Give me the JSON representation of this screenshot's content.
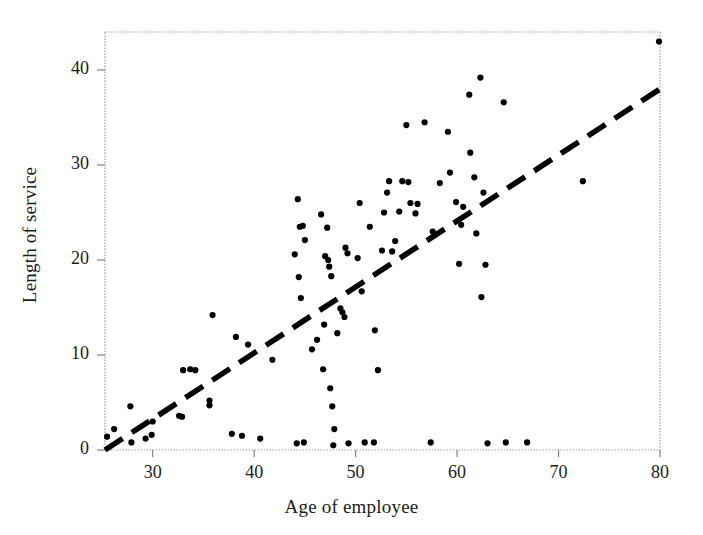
{
  "chart_data": {
    "type": "scatter",
    "title": "",
    "xlabel": "Age of employee",
    "ylabel": "Length of service",
    "xlim": [
      25.3,
      80
    ],
    "ylim": [
      0,
      44
    ],
    "xticks": [
      30,
      40,
      50,
      60,
      70,
      80
    ],
    "yticks": [
      0,
      10,
      20,
      30,
      40
    ],
    "grid": false,
    "legend": null,
    "series": [
      {
        "name": "employees",
        "marker": "filled-circle",
        "color": "#000000",
        "points": [
          [
            25.5,
            1.4
          ],
          [
            26.2,
            2.2
          ],
          [
            27.9,
            0.8
          ],
          [
            27.8,
            4.6
          ],
          [
            29.3,
            1.2
          ],
          [
            29.9,
            1.6
          ],
          [
            30.0,
            3.0
          ],
          [
            32.6,
            3.6
          ],
          [
            32.9,
            3.5
          ],
          [
            33.0,
            8.4
          ],
          [
            33.7,
            8.5
          ],
          [
            34.2,
            8.4
          ],
          [
            35.6,
            4.7
          ],
          [
            35.6,
            5.2
          ],
          [
            35.9,
            14.2
          ],
          [
            37.8,
            1.7
          ],
          [
            38.2,
            11.9
          ],
          [
            38.8,
            1.5
          ],
          [
            39.4,
            11.1
          ],
          [
            40.6,
            1.2
          ],
          [
            41.8,
            9.5
          ],
          [
            44.0,
            20.6
          ],
          [
            44.2,
            0.7
          ],
          [
            44.3,
            26.4
          ],
          [
            44.4,
            18.2
          ],
          [
            44.5,
            23.5
          ],
          [
            44.6,
            16.0
          ],
          [
            44.8,
            23.6
          ],
          [
            44.9,
            0.8
          ],
          [
            45.0,
            22.1
          ],
          [
            45.7,
            10.6
          ],
          [
            46.2,
            11.6
          ],
          [
            46.6,
            24.8
          ],
          [
            46.8,
            8.5
          ],
          [
            46.9,
            13.2
          ],
          [
            47.0,
            20.4
          ],
          [
            47.2,
            23.4
          ],
          [
            47.3,
            20.0
          ],
          [
            47.4,
            19.3
          ],
          [
            47.5,
            6.5
          ],
          [
            47.6,
            18.3
          ],
          [
            47.7,
            4.6
          ],
          [
            47.8,
            0.5
          ],
          [
            47.9,
            2.2
          ],
          [
            48.2,
            12.3
          ],
          [
            48.5,
            14.9
          ],
          [
            48.7,
            14.5
          ],
          [
            48.9,
            14.0
          ],
          [
            49.0,
            21.3
          ],
          [
            49.2,
            20.7
          ],
          [
            49.3,
            0.7
          ],
          [
            50.2,
            20.2
          ],
          [
            50.4,
            26.0
          ],
          [
            50.6,
            16.7
          ],
          [
            50.9,
            0.8
          ],
          [
            51.4,
            23.5
          ],
          [
            51.8,
            0.8
          ],
          [
            51.9,
            12.6
          ],
          [
            52.2,
            8.4
          ],
          [
            52.6,
            21.0
          ],
          [
            52.8,
            25.0
          ],
          [
            53.1,
            27.1
          ],
          [
            53.3,
            28.3
          ],
          [
            53.6,
            20.9
          ],
          [
            53.9,
            22.0
          ],
          [
            54.3,
            25.1
          ],
          [
            54.6,
            28.3
          ],
          [
            55.0,
            34.2
          ],
          [
            55.2,
            28.2
          ],
          [
            55.4,
            26.0
          ],
          [
            55.9,
            24.9
          ],
          [
            56.1,
            25.9
          ],
          [
            56.8,
            34.5
          ],
          [
            57.4,
            0.8
          ],
          [
            57.6,
            23.0
          ],
          [
            58.3,
            28.1
          ],
          [
            59.1,
            33.5
          ],
          [
            59.3,
            29.2
          ],
          [
            59.9,
            26.1
          ],
          [
            60.2,
            19.6
          ],
          [
            60.4,
            23.7
          ],
          [
            60.6,
            25.6
          ],
          [
            61.2,
            37.4
          ],
          [
            61.3,
            31.3
          ],
          [
            61.7,
            28.7
          ],
          [
            61.9,
            22.8
          ],
          [
            62.3,
            39.2
          ],
          [
            62.4,
            16.1
          ],
          [
            62.6,
            27.1
          ],
          [
            62.8,
            19.5
          ],
          [
            63.0,
            0.7
          ],
          [
            64.6,
            36.6
          ],
          [
            64.8,
            0.8
          ],
          [
            66.9,
            0.8
          ],
          [
            72.4,
            28.3
          ],
          [
            79.9,
            43.0
          ]
        ]
      }
    ],
    "trendline": {
      "name": "fit-line",
      "style": "dashed",
      "color": "#000000",
      "x_start": 25.3,
      "y_start": 0.0,
      "x_end": 80.0,
      "y_end": 38.0
    }
  },
  "axis": {
    "xtick_labels": [
      "30",
      "40",
      "50",
      "60",
      "70",
      "80"
    ],
    "ytick_labels": [
      "0",
      "10",
      "20",
      "30",
      "40"
    ],
    "frame_color": "#9a9a9a",
    "frame_style": "dotted"
  }
}
